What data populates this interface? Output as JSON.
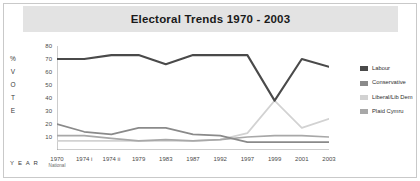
{
  "title": "Electoral Trends 1970 - 2003",
  "axis": {
    "y_caption_letters": [
      "%",
      "V",
      "O",
      "T",
      "E"
    ],
    "x_caption": "Y E A R",
    "y_ticks": [
      0,
      10,
      20,
      30,
      40,
      50,
      60,
      70,
      80
    ],
    "y_tick_labels": [
      "",
      "10",
      "20",
      "30",
      "40",
      "50",
      "60",
      "70",
      "80"
    ]
  },
  "legend": {
    "items": [
      {
        "label": "Labour",
        "color": "#4a4a4a"
      },
      {
        "label": "Conservative",
        "color": "#8a8a8a"
      },
      {
        "label": "Liberal/Lib Dem",
        "color": "#d2d2d2"
      },
      {
        "label": "Plaid Cymru",
        "color": "#a8a8a8"
      }
    ]
  },
  "chart_data": {
    "type": "line",
    "title": "Electoral Trends 1970 - 2003",
    "xlabel": "Y E A R",
    "ylabel": "% VOTE",
    "ylim": [
      0,
      80
    ],
    "grid": false,
    "legend_position": "right",
    "categories": [
      "1970",
      "1974 i",
      "1974 ii",
      "1979",
      "1983",
      "1987",
      "1992",
      "1997",
      "1999",
      "2001",
      "2003"
    ],
    "category_sublabels": [
      "National",
      "",
      "",
      "",
      "",
      "",
      "",
      "",
      "",
      "",
      ""
    ],
    "series": [
      {
        "name": "Labour",
        "color": "#4a4a4a",
        "values": [
          70,
          70,
          73,
          73,
          66,
          73,
          73,
          73,
          38,
          70,
          64
        ]
      },
      {
        "name": "Conservative",
        "color": "#8a8a8a",
        "values": [
          20,
          14,
          12,
          17,
          17,
          12,
          11,
          6,
          6,
          6,
          6
        ]
      },
      {
        "name": "Liberal/Lib Dem",
        "color": "#d2d2d2",
        "values": [
          7,
          7,
          7,
          7,
          7,
          7,
          8,
          13,
          38,
          17,
          24
        ]
      },
      {
        "name": "Plaid Cymru",
        "color": "#a8a8a8",
        "values": [
          11,
          11,
          9,
          7,
          8,
          7,
          8,
          10,
          11,
          11,
          10
        ]
      }
    ]
  }
}
